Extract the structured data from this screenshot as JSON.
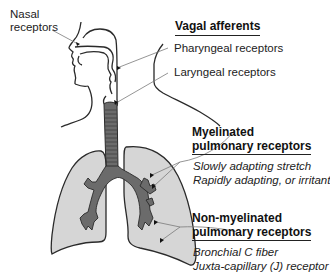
{
  "diagram": {
    "type": "anatomical-illustration",
    "colors": {
      "lung_fill": "#d6d6d6",
      "airway_fill": "#6b6b6b",
      "outline": "#2a2a2a",
      "leader_line": "#7a7a7a",
      "background": "#ffffff"
    }
  },
  "labels": {
    "nasal": {
      "line1": "Nasal",
      "line2": "receptors"
    },
    "vagal_header": "Vagal afferents",
    "pharyngeal": "Pharyngeal receptors",
    "laryngeal": "Laryngeal receptors",
    "myelinated": {
      "header_line1": "Myelinated",
      "header_line2": "pulmonary receptors",
      "items": [
        "Slowly adapting stretch",
        "Rapidly adapting, or irritant"
      ]
    },
    "non_myelinated": {
      "header_line1": "Non-myelinated",
      "header_line2": "pulmonary receptors",
      "items": [
        "Bronchial C fiber",
        "Juxta-capillary (J) receptor"
      ]
    }
  }
}
